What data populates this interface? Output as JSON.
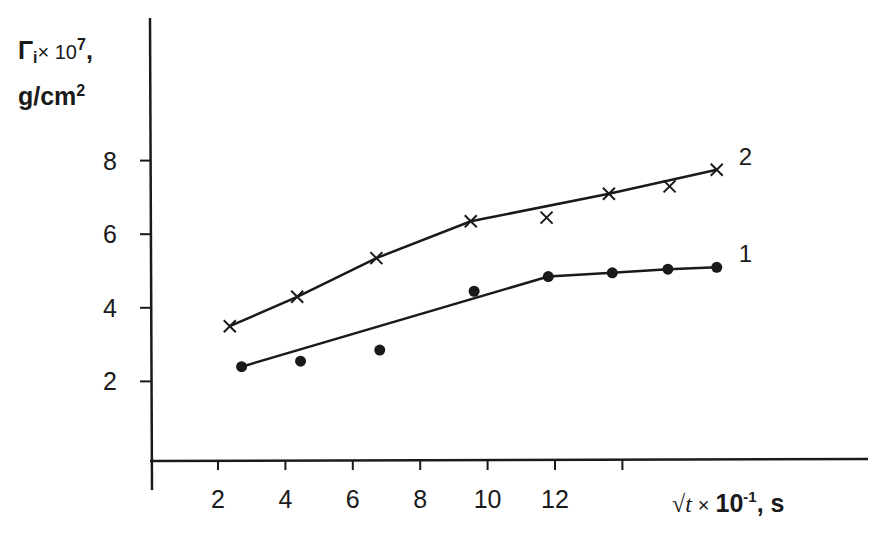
{
  "chart_data": {
    "type": "line",
    "title": "",
    "ylabel": {
      "symbol": "Γ",
      "subscript": "i",
      "multiplier": "× 10",
      "exponent": "7",
      "unit_prefix": "g/cm",
      "unit_exp": "2"
    },
    "xlabel": {
      "symbol": "√t",
      "multiplier": "× 10",
      "exponent": "-1",
      "unit": ", s"
    },
    "x_ticks": [
      2,
      4,
      6,
      8,
      10,
      12,
      14
    ],
    "x_tick_labels": [
      "2",
      "4",
      "6",
      "8",
      "10",
      "12",
      ""
    ],
    "y_ticks": [
      2,
      4,
      6,
      8
    ],
    "y_tick_labels": [
      "2",
      "4",
      "6",
      "8"
    ],
    "xlim": [
      0,
      21
    ],
    "ylim": [
      0,
      12
    ],
    "grid": false,
    "legend": "inline curve labels at right end",
    "series": [
      {
        "name": "1",
        "marker": "filled-circle",
        "points": [
          [
            2.7,
            2.4
          ],
          [
            4.45,
            2.55
          ],
          [
            6.8,
            2.85
          ],
          [
            9.6,
            4.45
          ],
          [
            11.8,
            4.85
          ],
          [
            13.7,
            4.95
          ],
          [
            15.35,
            5.05
          ],
          [
            16.8,
            5.1
          ]
        ],
        "fit_line": [
          [
            2.7,
            2.4
          ],
          [
            11.8,
            4.85
          ],
          [
            13.7,
            4.95
          ],
          [
            15.35,
            5.05
          ],
          [
            16.8,
            5.1
          ]
        ]
      },
      {
        "name": "2",
        "marker": "x",
        "points": [
          [
            2.35,
            3.5
          ],
          [
            4.35,
            4.3
          ],
          [
            6.7,
            5.35
          ],
          [
            9.5,
            6.35
          ],
          [
            11.75,
            6.45
          ],
          [
            13.6,
            7.1
          ],
          [
            15.4,
            7.3
          ],
          [
            16.8,
            7.75
          ]
        ],
        "fit_line": [
          [
            2.35,
            3.5
          ],
          [
            4.35,
            4.3
          ],
          [
            6.7,
            5.35
          ],
          [
            9.5,
            6.35
          ],
          [
            13.6,
            7.1
          ],
          [
            16.8,
            7.75
          ]
        ]
      }
    ]
  },
  "colors": {
    "ink": "#1a1a1a",
    "background": "#ffffff"
  }
}
